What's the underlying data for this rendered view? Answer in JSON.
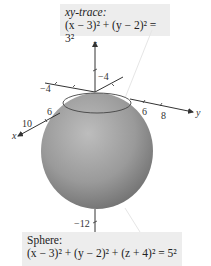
{
  "trace_label": {
    "title": "xy-trace:",
    "equation": "(x − 3)² + (y − 2)² = 3²"
  },
  "sphere_label": {
    "title": "Sphere:",
    "equation": "(x − 3)² + (y − 2)² + (z + 4)² = 5²"
  },
  "axes": {
    "x": {
      "label": "x",
      "ticks": [
        "6",
        "10"
      ]
    },
    "y": {
      "label": "y",
      "ticks": [
        "-4",
        "6",
        "8"
      ]
    },
    "z": {
      "label": "z",
      "ticks": [
        "-4",
        "-12"
      ]
    }
  },
  "tick_labels": {
    "z_neg4": "−4",
    "y_neg4": "−4",
    "x_6": "6",
    "x_10": "10",
    "y_6": "6",
    "y_8": "8",
    "z_neg12": "−12",
    "x_axis": "x",
    "y_axis": "y",
    "z_axis": "z"
  },
  "colors": {
    "sphere_light": "#c8c8c8",
    "sphere_dark": "#7a7a7a",
    "label_bg": "#ededed",
    "axis": "#333333"
  }
}
